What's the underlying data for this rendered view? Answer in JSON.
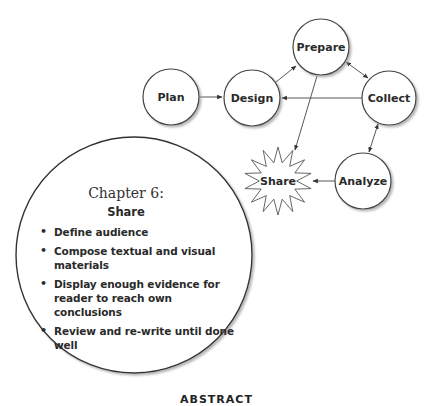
{
  "diagram": {
    "nodes": [
      {
        "id": "plan",
        "label": "Plan",
        "shape": "circle",
        "cx": 171,
        "cy": 97,
        "r": 28
      },
      {
        "id": "design",
        "label": "Design",
        "shape": "circle",
        "cx": 252,
        "cy": 98,
        "r": 28
      },
      {
        "id": "prepare",
        "label": "Prepare",
        "shape": "circle",
        "cx": 321,
        "cy": 47,
        "r": 28
      },
      {
        "id": "collect",
        "label": "Collect",
        "shape": "circle",
        "cx": 389,
        "cy": 98,
        "r": 27
      },
      {
        "id": "analyze",
        "label": "Analyze",
        "shape": "circle",
        "cx": 363,
        "cy": 181,
        "r": 28
      },
      {
        "id": "share",
        "label": "Share",
        "shape": "starburst",
        "cx": 278,
        "cy": 181,
        "r": 34
      }
    ],
    "edges": [
      {
        "from": "plan",
        "to": "design",
        "type": "arrow"
      },
      {
        "from": "design",
        "to": "prepare",
        "type": "arrow"
      },
      {
        "from": "prepare",
        "to": "collect",
        "type": "double-arrow"
      },
      {
        "from": "collect",
        "to": "design",
        "type": "arrow"
      },
      {
        "from": "prepare",
        "to": "share",
        "type": "arrow"
      },
      {
        "from": "collect",
        "to": "analyze",
        "type": "double-arrow"
      },
      {
        "from": "analyze",
        "to": "share",
        "type": "arrow"
      }
    ]
  },
  "chapter": {
    "title": "Chapter 6:",
    "subtitle": "Share",
    "bullets": [
      "Define audience",
      "Compose textual and visual materials",
      "Display enough evidence for reader to reach own conclusions",
      "Review and re-write until done well"
    ]
  },
  "footer": {
    "text": "ABSTRACT"
  },
  "colors": {
    "stroke": "#444444",
    "text": "#2a2a2a",
    "shadow": "#bbbbbb"
  }
}
